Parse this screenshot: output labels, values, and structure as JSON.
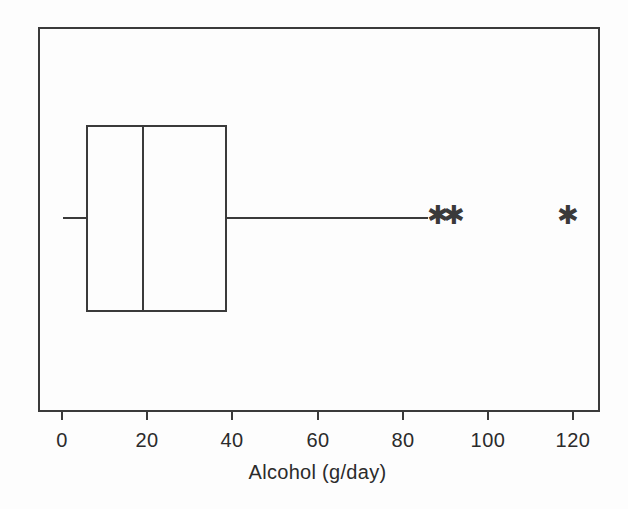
{
  "figure": {
    "background_color": "#fdfdfd",
    "ink_color": "#3a3a3a",
    "frame": {
      "left": 39,
      "top": 28,
      "right": 599,
      "bottom": 411
    }
  },
  "axis": {
    "title": "Alcohol (g/day)",
    "tick_labels": [
      "0",
      "20",
      "40",
      "60",
      "80",
      "100",
      "120"
    ],
    "tick_values": [
      0,
      20,
      40,
      60,
      80,
      100,
      120
    ],
    "tick_pixel_x": [
      62,
      147,
      232,
      318,
      403,
      488,
      573
    ],
    "tick_length_px": 9,
    "px_per_unit": 4.26
  },
  "chart_data": {
    "type": "box",
    "orientation": "horizontal",
    "title": "",
    "xlabel": "Alcohol (g/day)",
    "ylabel": "",
    "xlim": [
      -5.5,
      126
    ],
    "grid": false,
    "legend": null,
    "categories": [
      "Alcohol (g/day)"
    ],
    "series": [
      {
        "name": "Alcohol (g/day)",
        "whisker_low": 0,
        "q1": 6,
        "median": 19,
        "q3": 38.5,
        "whisker_high": 86,
        "outliers": [
          88.5,
          92,
          119
        ],
        "outlier_marker": "asterisk"
      }
    ],
    "box_geometry_px": {
      "left": 87,
      "right": 226,
      "median": 143,
      "top": 126,
      "bottom": 311,
      "center_y": 218,
      "whisker_low_x": 63,
      "whisker_high_x": 428,
      "outlier_x": [
        438,
        454,
        568
      ]
    }
  }
}
